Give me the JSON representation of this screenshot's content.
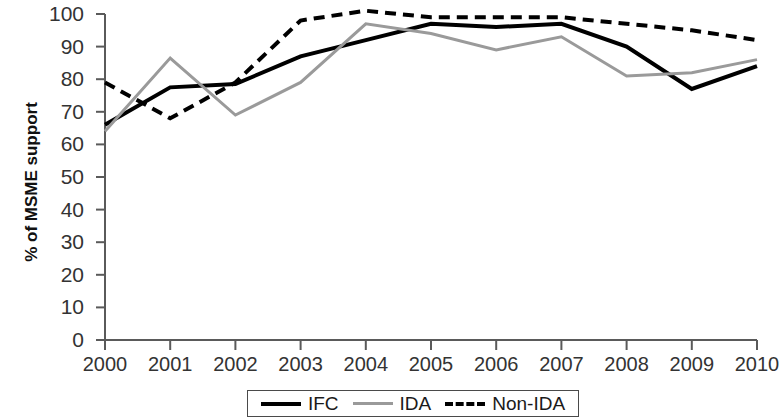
{
  "chart_data": {
    "type": "line",
    "title": "",
    "xlabel": "",
    "ylabel": "% of MSME support",
    "x": [
      2000,
      2001,
      2002,
      2003,
      2004,
      2005,
      2006,
      2007,
      2008,
      2009,
      2010
    ],
    "categories": [
      "2000",
      "2001",
      "2002",
      "2003",
      "2004",
      "2005",
      "2006",
      "2007",
      "2008",
      "2009",
      "2010"
    ],
    "xlim": [
      2000,
      2010
    ],
    "ylim": [
      0,
      100
    ],
    "ytick_labels": [
      "0",
      "10",
      "20",
      "30",
      "40",
      "50",
      "60",
      "70",
      "80",
      "90",
      "100"
    ],
    "ytick_values": [
      0,
      10,
      20,
      30,
      40,
      50,
      60,
      70,
      80,
      90,
      100
    ],
    "grid": false,
    "legend_position": "bottom",
    "series": [
      {
        "name": "IFC",
        "style": "solid",
        "color": "#000000",
        "width": 4,
        "values": [
          66,
          77.5,
          78.5,
          87,
          92,
          97,
          96,
          97,
          90,
          77,
          84
        ]
      },
      {
        "name": "IDA",
        "style": "solid",
        "color": "#9a9a9a",
        "width": 3,
        "values": [
          64,
          86.5,
          69,
          79,
          97,
          94,
          89,
          93,
          81,
          82,
          86
        ]
      },
      {
        "name": "Non-IDA",
        "style": "dashed",
        "color": "#000000",
        "width": 4,
        "values": [
          79,
          68,
          79,
          98,
          101,
          99,
          99,
          99,
          97,
          95,
          92
        ]
      }
    ]
  },
  "axes": {
    "y_label": "% of MSME support"
  },
  "legend": {
    "items": [
      {
        "label": "IFC",
        "swatch": "solid-black"
      },
      {
        "label": "IDA",
        "swatch": "solid-gray"
      },
      {
        "label": "Non-IDA",
        "swatch": "dashed-black"
      }
    ]
  }
}
